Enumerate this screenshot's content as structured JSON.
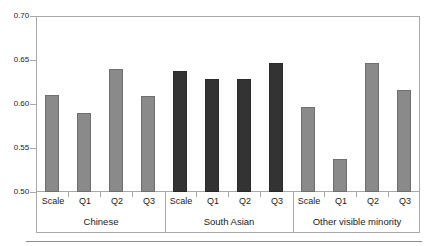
{
  "chart_data": {
    "type": "bar",
    "title": "",
    "xlabel": "",
    "ylabel": "",
    "ylim": [
      0.5,
      0.7
    ],
    "ytick_labels": [
      "0.70",
      "0.65",
      "0.60",
      "0.55",
      "0.50"
    ],
    "ytick_values": [
      0.7,
      0.65,
      0.6,
      0.55,
      0.5
    ],
    "grid": false,
    "legend": "none",
    "categories": [
      "Scale",
      "Q1",
      "Q2",
      "Q3"
    ],
    "groups": [
      {
        "name": "Chinese",
        "color": "#8a8a8a",
        "bars": [
          {
            "label": "Scale",
            "value": 0.61
          },
          {
            "label": "Q1",
            "value": 0.59
          },
          {
            "label": "Q2",
            "value": 0.64
          },
          {
            "label": "Q3",
            "value": 0.609
          }
        ]
      },
      {
        "name": "South Asian",
        "color": "#333333",
        "bars": [
          {
            "label": "Scale",
            "value": 0.638
          },
          {
            "label": "Q1",
            "value": 0.628
          },
          {
            "label": "Q2",
            "value": 0.628
          },
          {
            "label": "Q3",
            "value": 0.647
          }
        ]
      },
      {
        "name": "Other visible minority",
        "color": "#8a8a8a",
        "bars": [
          {
            "label": "Scale",
            "value": 0.597
          },
          {
            "label": "Q1",
            "value": 0.537
          },
          {
            "label": "Q2",
            "value": 0.647
          },
          {
            "label": "Q3",
            "value": 0.616
          }
        ]
      }
    ],
    "colors": {
      "bar_light": "#8a8a8a",
      "bar_dark": "#333333",
      "frame": "#a8a8a8",
      "text": "#1a1a1a",
      "background": "#ffffff"
    }
  }
}
